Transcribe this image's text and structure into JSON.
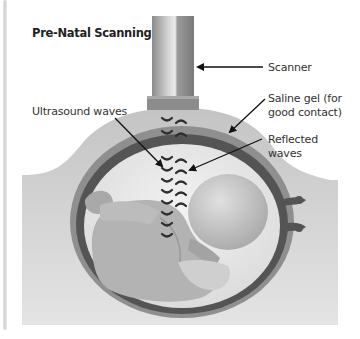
{
  "title": "Pre-Natal Scanning",
  "labels": {
    "scanner": "Scanner",
    "saline_gel_line1": "Saline gel (for",
    "saline_gel_line2": "good contact)",
    "ultrasound_waves": "Ultrasound waves",
    "reflected_line1": "Reflected",
    "reflected_line2": "waves"
  },
  "colors": {
    "background": "#ffffff",
    "abdomen": "#c9c9c9",
    "uterus_wall": "#555555",
    "gel_layer": "#8f8f8f",
    "fluid": "#e6e6e6",
    "fetus": "#b5b5b5",
    "wave": "#333333",
    "arrow": "#111111"
  }
}
